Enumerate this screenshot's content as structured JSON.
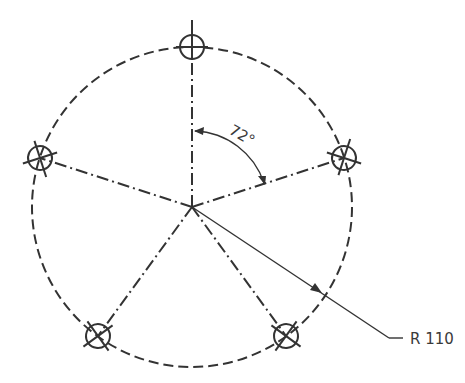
{
  "drawing": {
    "title": "Bolt circle with five holes at 72° spacing",
    "colors": {
      "line": "#333333",
      "background": "#ffffff"
    },
    "center": {
      "x": 192,
      "y": 207
    },
    "pitch_circle_radius_px": 160,
    "hole_radius_px": 12,
    "hole_count": 5,
    "angle_label": "72°",
    "radius_label": "R 110",
    "holes": [
      {
        "id": "hole-top",
        "angle_deg": 90
      },
      {
        "id": "hole-right",
        "angle_deg": 18
      },
      {
        "id": "hole-bottom-right",
        "angle_deg": -54
      },
      {
        "id": "hole-bottom-left",
        "angle_deg": -126
      },
      {
        "id": "hole-left",
        "angle_deg": 162
      }
    ]
  }
}
